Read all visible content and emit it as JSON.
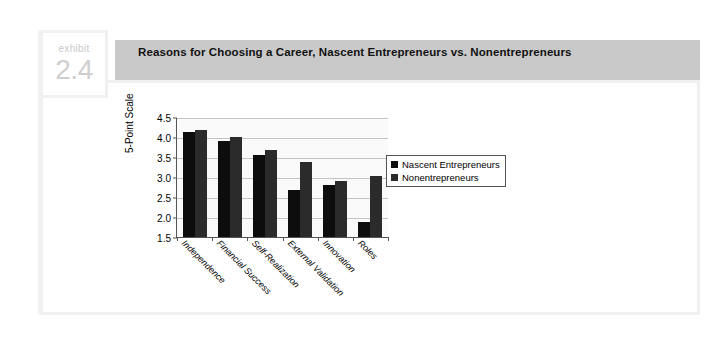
{
  "exhibit": {
    "word": "exhibit",
    "number": "2.4"
  },
  "header": {
    "title": "Reasons for Choosing a Career, Nascent Entrepreneurs vs. Nonentrepreneurs"
  },
  "chart_data": {
    "type": "bar",
    "title": "Reasons for Choosing a Career, Nascent Entrepreneurs vs. Nonentrepreneurs",
    "xlabel": "",
    "ylabel": "5-Point Scale",
    "ylim": [
      1.5,
      4.5
    ],
    "ytick_labels": [
      "4.5",
      "4.0",
      "3.5",
      "3.0",
      "2.5",
      "2.0",
      "1.5"
    ],
    "ytick_values": [
      4.5,
      4.0,
      3.5,
      3.0,
      2.5,
      2.0,
      1.5
    ],
    "grid": true,
    "legend_position": "right",
    "categories": [
      "Independence",
      "Financial Success",
      "Self-Realization",
      "External Validation",
      "Innovation",
      "Roles"
    ],
    "series": [
      {
        "name": "Nascent Entrepreneurs",
        "color": "#0d0d0d",
        "values": [
          4.13,
          3.9,
          3.55,
          2.68,
          2.79,
          1.88
        ]
      },
      {
        "name": "Nonentrepreneurs",
        "color": "#2b2b2b",
        "values": [
          4.17,
          4.0,
          3.67,
          3.37,
          2.91,
          3.03
        ]
      }
    ]
  }
}
